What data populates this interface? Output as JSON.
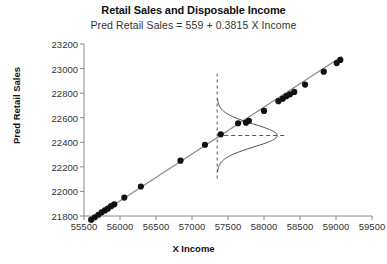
{
  "chart_data": {
    "type": "scatter",
    "title": "Retail Sales and Disposable Income",
    "subtitle": "Pred Retail Sales  =  559  +  0.3815 X  Income",
    "xlabel": "X  Income",
    "ylabel": "Pred Retail Sales",
    "xlim": [
      55500,
      59500
    ],
    "ylim": [
      21800,
      23200
    ],
    "xticks": [
      55500,
      56000,
      56500,
      57000,
      57500,
      58000,
      58500,
      59000,
      59500
    ],
    "yticks": [
      21800,
      22000,
      22200,
      22400,
      22600,
      22800,
      23000,
      23200
    ],
    "grid": false,
    "legend": "none",
    "regression": {
      "intercept": 559,
      "slope": 0.3815,
      "label": "Pred Retail Sales  =  559  +  0.3815 X  Income",
      "color": "#8c8c8c",
      "x_start": 55560,
      "x_end": 59080
    },
    "series": [
      {
        "name": "Observed",
        "marker": "filled-circle",
        "color": "#111111",
        "points": [
          {
            "x": 55600,
            "y": 21770
          },
          {
            "x": 55650,
            "y": 21790
          },
          {
            "x": 55700,
            "y": 21810
          },
          {
            "x": 55745,
            "y": 21830
          },
          {
            "x": 55790,
            "y": 21845
          },
          {
            "x": 55830,
            "y": 21860
          },
          {
            "x": 55875,
            "y": 21880
          },
          {
            "x": 55920,
            "y": 21895
          },
          {
            "x": 56060,
            "y": 21950
          },
          {
            "x": 56290,
            "y": 22040
          },
          {
            "x": 56840,
            "y": 22250
          },
          {
            "x": 57180,
            "y": 22380
          },
          {
            "x": 57400,
            "y": 22465
          },
          {
            "x": 57640,
            "y": 22555
          },
          {
            "x": 57750,
            "y": 22560
          },
          {
            "x": 57790,
            "y": 22575
          },
          {
            "x": 58000,
            "y": 22655
          },
          {
            "x": 58200,
            "y": 22735
          },
          {
            "x": 58260,
            "y": 22755
          },
          {
            "x": 58310,
            "y": 22775
          },
          {
            "x": 58360,
            "y": 22790
          },
          {
            "x": 58420,
            "y": 22810
          },
          {
            "x": 58570,
            "y": 22870
          },
          {
            "x": 58830,
            "y": 22975
          },
          {
            "x": 59010,
            "y": 23045
          },
          {
            "x": 59060,
            "y": 23070
          }
        ]
      }
    ],
    "annotations": {
      "conditional_distribution": {
        "type": "normal-curve-sideways",
        "x_at": 57350,
        "mean_y": 22455,
        "description": "Normal distribution of Y at given X"
      },
      "vertical_reference_line": {
        "x": 57350,
        "style": "dashed",
        "color": "#555555"
      },
      "horizontal_reference_line": {
        "y": 22455,
        "style": "dashed",
        "color": "#555555"
      }
    }
  }
}
